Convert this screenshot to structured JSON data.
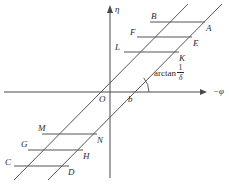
{
  "figure": {
    "background": "#ffffff",
    "line_color": "#555555",
    "axis_color": "#4a4a4a",
    "text_color": "#2b2b2b",
    "width": 229,
    "height": 186
  },
  "axes": {
    "vertical": {
      "label": "η",
      "name": "eta-axis",
      "x": 110,
      "y_top": 8,
      "y_bottom": 178,
      "arrow": "up"
    },
    "horizontal": {
      "label": "−φ",
      "name": "phi-axis",
      "y": 92,
      "x_left": 4,
      "x_right": 205,
      "arrow": "right"
    },
    "origin_label": "O",
    "intercept_label": "b"
  },
  "annotation": {
    "text": "arctan",
    "numerator": "1",
    "denominator": "δ",
    "full": "arctan 1/δ",
    "arc_radius": 16
  },
  "slanted_lines": [
    {
      "name": "upper-slant-line",
      "x1": 14,
      "y1": 180,
      "x2": 188,
      "y2": 4
    },
    {
      "name": "lower-slant-line",
      "x1": 48,
      "y1": 180,
      "x2": 222,
      "y2": 4
    }
  ],
  "upper_group": {
    "name": "upper-parallelogram-group",
    "segments": [
      {
        "left_label": "B",
        "right_label": "A",
        "x1": 150,
        "y1": 22,
        "x2": 205,
        "y2": 22
      },
      {
        "left_label": "F",
        "right_label": "E",
        "x1": 137,
        "y1": 37,
        "x2": 192,
        "y2": 37
      },
      {
        "left_label": "L",
        "right_label": "K",
        "x1": 124,
        "y1": 52,
        "x2": 179,
        "y2": 52
      }
    ]
  },
  "lower_group": {
    "name": "lower-parallelogram-group",
    "segments": [
      {
        "left_label": "M",
        "right_label": "N",
        "x1": 42,
        "y1": 134,
        "x2": 97,
        "y2": 134
      },
      {
        "left_label": "G",
        "right_label": "H",
        "x1": 28,
        "y1": 150,
        "x2": 83,
        "y2": 150
      },
      {
        "left_label": "C",
        "right_label": "D",
        "x1": 14,
        "y1": 166,
        "x2": 69,
        "y2": 166
      }
    ]
  },
  "labels": {
    "A": "A",
    "B": "B",
    "C": "C",
    "D": "D",
    "E": "E",
    "F": "F",
    "G": "G",
    "H": "H",
    "K": "K",
    "L": "L",
    "M": "M",
    "N": "N",
    "O": "O",
    "b": "b"
  }
}
